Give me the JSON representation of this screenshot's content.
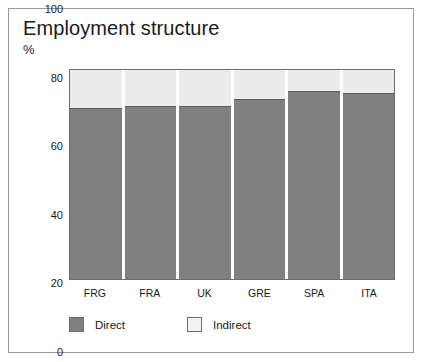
{
  "figure": {
    "title": "Employment structure",
    "unit_label": "%"
  },
  "legend": {
    "items": [
      {
        "label": "Direct",
        "color": "#808080",
        "swatch": "direct"
      },
      {
        "label": "Indirect",
        "color": "#ececec",
        "swatch": "indirect"
      }
    ]
  },
  "axes": {
    "y_ticks": [
      "0",
      "20",
      "40",
      "60",
      "80",
      "100"
    ],
    "x_ticks": [
      "FRG",
      "FRA",
      "UK",
      "GRE",
      "SPA",
      "ITA"
    ]
  },
  "chart_data": {
    "type": "bar",
    "stacked": true,
    "title": "Employment structure",
    "xlabel": "",
    "ylabel": "%",
    "ylim": [
      0,
      100
    ],
    "yticks": [
      0,
      20,
      40,
      60,
      80,
      100
    ],
    "grid": false,
    "legend_position": "bottom-left",
    "categories": [
      "FRG",
      "FRA",
      "UK",
      "GRE",
      "SPA",
      "ITA"
    ],
    "series": [
      {
        "name": "Direct",
        "color": "#808080",
        "values": [
          82,
          83,
          83,
          86,
          90,
          89
        ]
      },
      {
        "name": "Indirect",
        "color": "#ececec",
        "values": [
          18,
          17,
          17,
          14,
          10,
          11
        ]
      }
    ]
  }
}
